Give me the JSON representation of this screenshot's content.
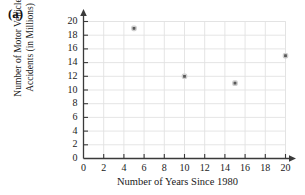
{
  "panel": {
    "label": "(a)"
  },
  "chart_data": {
    "type": "scatter",
    "title": "",
    "xlabel": "Number of Years Since 1980",
    "ylabel": "Number of Motor Vehicle\nAccidents (in Millions)",
    "ylabel_lines": [
      "Number of Motor Vehicle",
      "Accidents (in Millions)"
    ],
    "xlim": [
      0,
      20
    ],
    "ylim": [
      0,
      20
    ],
    "xticks": [
      0,
      2,
      4,
      6,
      8,
      10,
      12,
      14,
      16,
      18,
      20
    ],
    "yticks": [
      0,
      2,
      4,
      6,
      8,
      10,
      12,
      14,
      16,
      18,
      20
    ],
    "grid": true,
    "legend": false,
    "x": [
      5,
      10,
      15,
      20
    ],
    "y": [
      19,
      12,
      11,
      15
    ],
    "points": [
      {
        "x": 5,
        "y": 19
      },
      {
        "x": 10,
        "y": 12
      },
      {
        "x": 15,
        "y": 11
      },
      {
        "x": 20,
        "y": 15
      }
    ],
    "marker": "square",
    "marker_color": "#595959",
    "grid_color": "#e2e2e2",
    "axis_color": "#3a3a3a"
  }
}
